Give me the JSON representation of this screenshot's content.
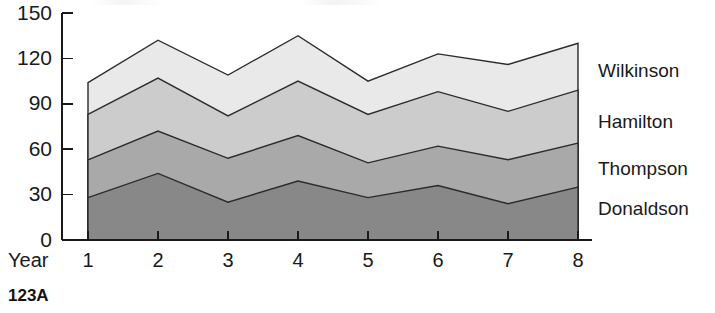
{
  "caption": "123A",
  "chart_data": {
    "type": "area",
    "stacked": true,
    "title": "",
    "xlabel": "Year",
    "ylabel": "",
    "categories": [
      "1",
      "2",
      "3",
      "4",
      "5",
      "6",
      "7",
      "8"
    ],
    "x": [
      1,
      2,
      3,
      4,
      5,
      6,
      7,
      8
    ],
    "xtick_labels": [
      "1",
      "2",
      "3",
      "4",
      "5",
      "6",
      "7",
      "8"
    ],
    "ytick_labels": [
      "0",
      "30",
      "60",
      "90",
      "120",
      "150"
    ],
    "yticks": [
      0,
      30,
      60,
      90,
      120,
      150
    ],
    "ylim": [
      0,
      150
    ],
    "xlim": [
      1,
      8
    ],
    "grid": false,
    "legend_position": "right-of-plot-inline",
    "series": [
      {
        "name": "Donaldson",
        "order": 1,
        "color": "#888888",
        "values": [
          28,
          44,
          25,
          39,
          28,
          36,
          24,
          35
        ],
        "cumulative": [
          28,
          44,
          25,
          39,
          28,
          36,
          24,
          35
        ]
      },
      {
        "name": "Thompson",
        "order": 2,
        "color": "#a9a9a9",
        "values": [
          25,
          28,
          29,
          30,
          23,
          26,
          29,
          29
        ],
        "cumulative": [
          53,
          72,
          54,
          69,
          51,
          62,
          53,
          64
        ]
      },
      {
        "name": "Hamilton",
        "order": 3,
        "color": "#cccccc",
        "values": [
          30,
          35,
          28,
          36,
          32,
          36,
          32,
          35
        ],
        "cumulative": [
          83,
          107,
          82,
          105,
          83,
          98,
          85,
          99
        ]
      },
      {
        "name": "Wilkinson",
        "order": 4,
        "color": "#e9e9e9",
        "values": [
          21,
          25,
          27,
          30,
          22,
          25,
          31,
          31
        ],
        "cumulative": [
          104,
          132,
          109,
          135,
          105,
          123,
          116,
          130
        ]
      }
    ],
    "legend_entries": [
      {
        "label": "Wilkinson",
        "color": "#e9e9e9",
        "y_anchor": 72
      },
      {
        "label": "Hamilton",
        "color": "#cccccc",
        "y_anchor": 123
      },
      {
        "label": "Thompson",
        "color": "#a9a9a9",
        "y_anchor": 170
      },
      {
        "label": "Donaldson",
        "color": "#888888",
        "y_anchor": 210
      }
    ],
    "outline_color": "#2b2b2b",
    "axis_color": "#1a1a1a"
  },
  "legend": {
    "wilkinson": "Wilkinson",
    "hamilton": "Hamilton",
    "thompson": "Thompson",
    "donaldson": "Donaldson"
  },
  "axes": {
    "x_title": "Year",
    "y_labels": [
      "150",
      "120",
      "90",
      "60",
      "30",
      "0"
    ],
    "x_labels": [
      "1",
      "2",
      "3",
      "4",
      "5",
      "6",
      "7",
      "8"
    ]
  }
}
